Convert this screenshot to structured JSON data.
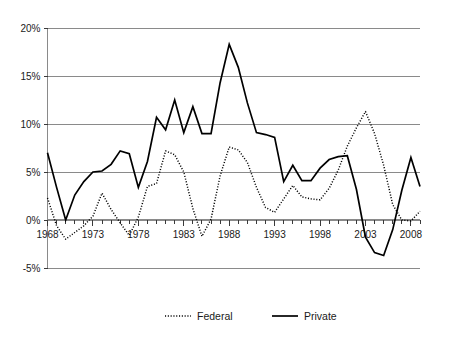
{
  "chart_data": {
    "type": "line",
    "title": "",
    "subtitle": "",
    "xlabel": "",
    "ylabel": "",
    "xlim": [
      1968,
      2009
    ],
    "ylim": [
      -5,
      20
    ],
    "y_ticks": [
      -5,
      0,
      5,
      10,
      15,
      20
    ],
    "y_tick_labels": [
      "-5%",
      "0%",
      "5%",
      "10%",
      "15%",
      "20%"
    ],
    "x_ticks": [
      1968,
      1969,
      1970,
      1971,
      1972,
      1973,
      1974,
      1975,
      1976,
      1977,
      1978,
      1979,
      1980,
      1981,
      1982,
      1983,
      1984,
      1985,
      1986,
      1987,
      1988,
      1989,
      1990,
      1991,
      1992,
      1993,
      1994,
      1995,
      1996,
      1997,
      1998,
      1999,
      2000,
      2001,
      2002,
      2003,
      2004,
      2005,
      2006,
      2007,
      2008,
      2009
    ],
    "x_tick_labels": [
      "1968",
      "1973",
      "1978",
      "1983",
      "1988",
      "1993",
      "1998",
      "2003",
      "2008"
    ],
    "x_labeled_years": [
      1968,
      1973,
      1978,
      1983,
      1988,
      1993,
      1998,
      2003,
      2008
    ],
    "grid": "horizontal",
    "legend_position": "bottom",
    "x": [
      1968,
      1969,
      1970,
      1971,
      1972,
      1973,
      1974,
      1975,
      1976,
      1977,
      1978,
      1979,
      1980,
      1981,
      1982,
      1983,
      1984,
      1985,
      1986,
      1987,
      1988,
      1989,
      1990,
      1991,
      1992,
      1993,
      1994,
      1995,
      1996,
      1997,
      1998,
      1999,
      2000,
      2001,
      2002,
      2003,
      2004,
      2005,
      2006,
      2007,
      2008,
      2009
    ],
    "series": [
      {
        "name": "Federal",
        "style": "dotted",
        "color": "#000000",
        "values": [
          2.3,
          -0.6,
          -2.0,
          -1.3,
          -0.6,
          0.4,
          2.8,
          1.1,
          -0.3,
          -1.6,
          0.3,
          3.5,
          3.8,
          7.2,
          6.8,
          5.0,
          1.2,
          -1.7,
          0.1,
          4.6,
          7.6,
          7.3,
          6.0,
          3.4,
          1.3,
          0.8,
          2.2,
          3.6,
          2.4,
          2.2,
          2.1,
          3.3,
          5.2,
          7.7,
          9.6,
          11.3,
          9.0,
          5.7,
          1.6,
          0.0,
          -0.1,
          0.9
        ]
      },
      {
        "name": "Private",
        "style": "solid",
        "color": "#000000",
        "values": [
          7.0,
          3.4,
          0.0,
          2.6,
          4.0,
          5.0,
          5.1,
          5.8,
          7.2,
          6.9,
          3.4,
          6.1,
          10.7,
          9.4,
          12.5,
          9.1,
          11.8,
          9.0,
          9.0,
          14.3,
          18.3,
          15.9,
          12.2,
          9.1,
          8.9,
          8.6,
          4.0,
          5.7,
          4.1,
          4.1,
          5.4,
          6.3,
          6.6,
          6.7,
          3.2,
          -1.8,
          -3.4,
          -3.7,
          -1.0,
          3.1,
          6.5,
          3.5
        ]
      }
    ]
  },
  "legend": {
    "items": [
      {
        "label": "Federal",
        "style": "dotted"
      },
      {
        "label": "Private",
        "style": "solid"
      }
    ]
  }
}
